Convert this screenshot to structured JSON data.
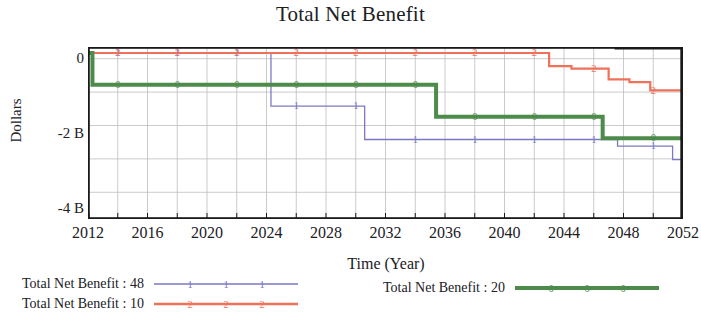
{
  "chart_data": {
    "type": "line",
    "title": "Total Net Benefit",
    "xlabel": "Time (Year)",
    "ylabel": "Dollars",
    "xlim": [
      2012,
      2052
    ],
    "ylim": [
      -4.8,
      0.35
    ],
    "grid": true,
    "x_ticks": [
      "2012",
      "2016",
      "2020",
      "2024",
      "2028",
      "2032",
      "2036",
      "2040",
      "2044",
      "2048",
      "2052"
    ],
    "x_tick_values": [
      2012,
      2016,
      2020,
      2024,
      2028,
      2032,
      2036,
      2040,
      2044,
      2048,
      2052
    ],
    "y_ticks": [
      "0",
      "-2 B",
      "-4 B"
    ],
    "y_tick_values": [
      0,
      -2,
      -4
    ],
    "y_unit": "B",
    "legend_position": "bottom",
    "interpolation": "step",
    "series": [
      {
        "name": "Total Net Benefit : 48",
        "marker": "1",
        "color": "#7b79c4",
        "width": 1.3,
        "x": [
          2012,
          2012.2,
          2024.3,
          2024.3,
          2030.6,
          2030.6,
          2047.6,
          2047.6,
          2051.3,
          2051.3,
          2052
        ],
        "y": [
          0.17,
          0.17,
          0.17,
          -1.42,
          -1.42,
          -2.42,
          -2.42,
          -2.62,
          -2.62,
          -3.02,
          -3.02
        ]
      },
      {
        "name": "Total Net Benefit : 10",
        "marker": "2",
        "color": "#f0715a",
        "width": 2.2,
        "x": [
          2012,
          2043.0,
          2043.0,
          2044.5,
          2044.5,
          2047.0,
          2047.0,
          2048.4,
          2048.4,
          2049.8,
          2049.8,
          2052
        ],
        "y": [
          0.17,
          0.17,
          -0.22,
          -0.22,
          -0.3,
          -0.3,
          -0.62,
          -0.62,
          -0.7,
          -0.7,
          -0.95,
          -0.95
        ]
      },
      {
        "name": "Total Net Benefit : 20",
        "marker": "0",
        "color": "#4d8b4a",
        "width": 4.0,
        "x": [
          2012,
          2012.3,
          2012.3,
          2035.4,
          2035.4,
          2046.6,
          2046.6,
          2052
        ],
        "y": [
          0.17,
          0.17,
          -0.78,
          -0.78,
          -1.74,
          -1.74,
          -2.38,
          -2.38
        ]
      }
    ]
  },
  "legend": {
    "entries": [
      {
        "label": "Total Net Benefit : 48",
        "color": "#7b79c4",
        "marker": "1"
      },
      {
        "label": "Total Net Benefit : 10",
        "color": "#f0715a",
        "marker": "2"
      },
      {
        "label": "Total Net Benefit : 20",
        "color": "#4d8b4a",
        "marker": "0"
      }
    ]
  },
  "frame": {
    "border_color": "#1a1a1a",
    "grid_color": "#bdbdbd",
    "background": "#ffffff"
  }
}
